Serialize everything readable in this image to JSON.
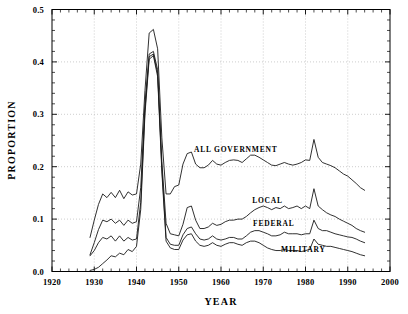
{
  "chart_data": {
    "type": "line",
    "title": "",
    "xlabel": "YEAR",
    "ylabel": "PROPORTION",
    "xlim": [
      1920,
      2000
    ],
    "ylim": [
      0.0,
      0.5
    ],
    "grid": true,
    "legend_position": "inline-annotations",
    "xticks": [
      1920,
      1930,
      1940,
      1950,
      1960,
      1970,
      1980,
      1990,
      2000
    ],
    "xtick_labels": [
      "1920",
      "1930",
      "1940",
      "1950",
      "1960",
      "1970",
      "1980",
      "1990",
      "2000"
    ],
    "yticks": [
      0.0,
      0.1,
      0.2,
      0.3,
      0.4,
      0.5
    ],
    "ytick_labels": [
      "0.0",
      "0.1",
      "0.2",
      "0.3",
      "0.4",
      "0.5"
    ],
    "x_minor_tick_interval": 2,
    "y_minor_tick_interval": 0.02,
    "annotations": [
      {
        "text": "ALL GOVERNMENT",
        "x": 1963.5,
        "y": 0.228
      },
      {
        "text": "LOCAL",
        "x": 1971.0,
        "y": 0.131
      },
      {
        "text": "FEDERAL",
        "x": 1972.5,
        "y": 0.086
      },
      {
        "text": "MILITARY",
        "x": 1979.5,
        "y": 0.038
      }
    ],
    "series": [
      {
        "name": "ALL GOVERNMENT",
        "x": [
          1929,
          1930,
          1931,
          1932,
          1933,
          1934,
          1935,
          1936,
          1937,
          1938,
          1939,
          1940,
          1941,
          1942,
          1943,
          1944,
          1945,
          1946,
          1947,
          1948,
          1949,
          1950,
          1951,
          1952,
          1953,
          1954,
          1955,
          1956,
          1957,
          1958,
          1959,
          1960,
          1961,
          1962,
          1963,
          1964,
          1965,
          1966,
          1967,
          1968,
          1969,
          1970,
          1971,
          1972,
          1973,
          1974,
          1975,
          1976,
          1977,
          1978,
          1979,
          1980,
          1981,
          1982,
          1983,
          1984,
          1985,
          1986,
          1987,
          1988,
          1989,
          1990,
          1991,
          1992,
          1993,
          1994
        ],
        "y": [
          0.065,
          0.098,
          0.128,
          0.148,
          0.141,
          0.151,
          0.141,
          0.155,
          0.139,
          0.152,
          0.146,
          0.148,
          0.205,
          0.345,
          0.455,
          0.462,
          0.425,
          0.255,
          0.148,
          0.148,
          0.162,
          0.165,
          0.205,
          0.225,
          0.228,
          0.205,
          0.198,
          0.198,
          0.203,
          0.212,
          0.205,
          0.203,
          0.208,
          0.212,
          0.213,
          0.212,
          0.208,
          0.215,
          0.222,
          0.222,
          0.218,
          0.213,
          0.208,
          0.203,
          0.202,
          0.205,
          0.208,
          0.205,
          0.203,
          0.205,
          0.208,
          0.213,
          0.212,
          0.252,
          0.218,
          0.208,
          0.205,
          0.202,
          0.198,
          0.192,
          0.186,
          0.182,
          0.175,
          0.168,
          0.16,
          0.155
        ]
      },
      {
        "name": "LOCAL",
        "x": [
          1929,
          1930,
          1931,
          1932,
          1933,
          1934,
          1935,
          1936,
          1937,
          1938,
          1939,
          1940,
          1941,
          1942,
          1943,
          1944,
          1945,
          1946,
          1947,
          1948,
          1949,
          1950,
          1951,
          1952,
          1953,
          1954,
          1955,
          1956,
          1957,
          1958,
          1959,
          1960,
          1961,
          1962,
          1963,
          1964,
          1965,
          1966,
          1967,
          1968,
          1969,
          1970,
          1971,
          1972,
          1973,
          1974,
          1975,
          1976,
          1977,
          1978,
          1979,
          1980,
          1981,
          1982,
          1983,
          1984,
          1985,
          1986,
          1987,
          1988,
          1989,
          1990,
          1991,
          1992,
          1993,
          1994
        ],
        "y": [
          0.032,
          0.055,
          0.08,
          0.098,
          0.095,
          0.1,
          0.092,
          0.098,
          0.088,
          0.098,
          0.092,
          0.095,
          0.16,
          0.32,
          0.415,
          0.42,
          0.385,
          0.21,
          0.092,
          0.072,
          0.07,
          0.068,
          0.09,
          0.122,
          0.125,
          0.098,
          0.082,
          0.082,
          0.085,
          0.092,
          0.088,
          0.09,
          0.095,
          0.098,
          0.098,
          0.1,
          0.1,
          0.105,
          0.112,
          0.118,
          0.122,
          0.125,
          0.122,
          0.118,
          0.122,
          0.12,
          0.125,
          0.12,
          0.122,
          0.125,
          0.12,
          0.125,
          0.12,
          0.158,
          0.125,
          0.118,
          0.112,
          0.108,
          0.105,
          0.1,
          0.096,
          0.092,
          0.088,
          0.082,
          0.078,
          0.075
        ]
      },
      {
        "name": "FEDERAL",
        "x": [
          1929,
          1930,
          1931,
          1932,
          1933,
          1934,
          1935,
          1936,
          1937,
          1938,
          1939,
          1940,
          1941,
          1942,
          1943,
          1944,
          1945,
          1946,
          1947,
          1948,
          1949,
          1950,
          1951,
          1952,
          1953,
          1954,
          1955,
          1956,
          1957,
          1958,
          1959,
          1960,
          1961,
          1962,
          1963,
          1964,
          1965,
          1966,
          1967,
          1968,
          1969,
          1970,
          1971,
          1972,
          1973,
          1974,
          1975,
          1976,
          1977,
          1978,
          1979,
          1980,
          1981,
          1982,
          1983,
          1984,
          1985,
          1986,
          1987,
          1988,
          1989,
          1990,
          1991,
          1992,
          1993,
          1994
        ],
        "y": [
          0.03,
          0.04,
          0.055,
          0.065,
          0.062,
          0.068,
          0.058,
          0.068,
          0.058,
          0.065,
          0.06,
          0.062,
          0.132,
          0.308,
          0.41,
          0.415,
          0.378,
          0.198,
          0.065,
          0.052,
          0.05,
          0.05,
          0.07,
          0.082,
          0.085,
          0.072,
          0.062,
          0.06,
          0.062,
          0.068,
          0.062,
          0.06,
          0.062,
          0.065,
          0.065,
          0.062,
          0.062,
          0.068,
          0.075,
          0.078,
          0.078,
          0.075,
          0.072,
          0.068,
          0.068,
          0.07,
          0.075,
          0.072,
          0.072,
          0.072,
          0.07,
          0.072,
          0.072,
          0.098,
          0.082,
          0.078,
          0.078,
          0.075,
          0.072,
          0.07,
          0.068,
          0.066,
          0.065,
          0.062,
          0.058,
          0.055
        ]
      },
      {
        "name": "MILITARY",
        "x": [
          1929,
          1930,
          1931,
          1932,
          1933,
          1934,
          1935,
          1936,
          1937,
          1938,
          1939,
          1940,
          1941,
          1942,
          1943,
          1944,
          1945,
          1946,
          1947,
          1948,
          1949,
          1950,
          1951,
          1952,
          1953,
          1954,
          1955,
          1956,
          1957,
          1958,
          1959,
          1960,
          1961,
          1962,
          1963,
          1964,
          1965,
          1966,
          1967,
          1968,
          1969,
          1970,
          1971,
          1972,
          1973,
          1974,
          1975,
          1976,
          1977,
          1978,
          1979,
          1980,
          1981,
          1982,
          1983,
          1984,
          1985,
          1986,
          1987,
          1988,
          1989,
          1990,
          1991,
          1992,
          1993,
          1994
        ],
        "y": [
          0.002,
          0.004,
          0.008,
          0.015,
          0.022,
          0.03,
          0.028,
          0.035,
          0.032,
          0.042,
          0.038,
          0.048,
          0.118,
          0.3,
          0.405,
          0.412,
          0.372,
          0.19,
          0.058,
          0.045,
          0.042,
          0.042,
          0.06,
          0.07,
          0.072,
          0.058,
          0.05,
          0.048,
          0.05,
          0.055,
          0.05,
          0.048,
          0.052,
          0.055,
          0.055,
          0.052,
          0.05,
          0.055,
          0.058,
          0.058,
          0.055,
          0.05,
          0.045,
          0.042,
          0.04,
          0.04,
          0.042,
          0.04,
          0.04,
          0.04,
          0.038,
          0.04,
          0.042,
          0.062,
          0.052,
          0.05,
          0.048,
          0.048,
          0.046,
          0.044,
          0.042,
          0.04,
          0.038,
          0.035,
          0.032,
          0.03
        ]
      }
    ]
  }
}
